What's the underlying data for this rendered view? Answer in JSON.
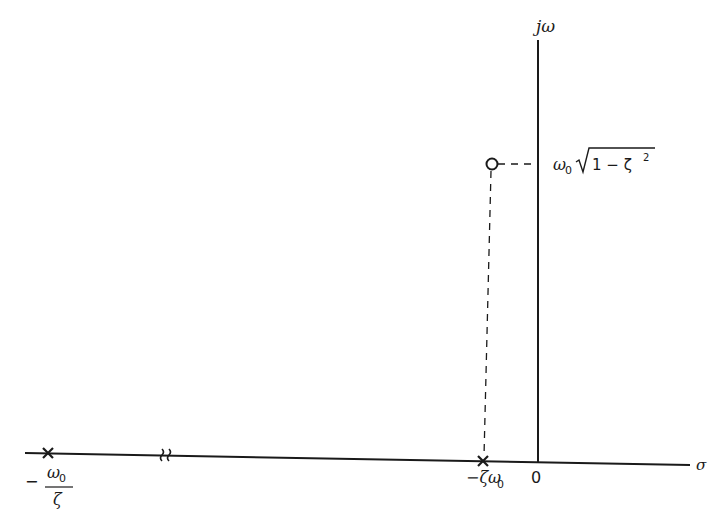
{
  "diagram": {
    "type": "pole-zero s-plane plot",
    "axes": {
      "vertical_label": "jω",
      "horizontal_label": "σ",
      "origin_label": "0"
    },
    "poles": [
      {
        "label_numerator": "ω",
        "label_numerator_sub": "0",
        "label_denominator": "ζ",
        "label_sign": "−",
        "symbol": "x"
      },
      {
        "label": "−ζω",
        "label_sub": "0",
        "symbol": "x"
      }
    ],
    "zero": {
      "label": "ω",
      "label_sub": "0",
      "label_sqrt": "1 − ζ",
      "label_sup": "2",
      "symbol": "o"
    },
    "axis_break_symbol": "≈"
  }
}
